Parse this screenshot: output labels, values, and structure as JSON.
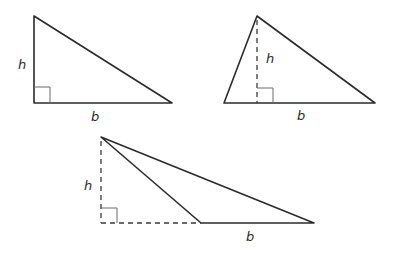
{
  "figure": {
    "triangles": [
      {
        "id": "right-triangle",
        "type": "right",
        "vertices": [
          [
            34,
            16
          ],
          [
            34,
            103
          ],
          [
            172,
            103
          ]
        ],
        "height_line": null,
        "base_extension": null,
        "right_angle_box": [
          34,
          87,
          16
        ],
        "labels": {
          "height": "h",
          "base": "b"
        },
        "label_positions": {
          "height": [
            18,
            69
          ],
          "base": [
            91,
            121
          ]
        }
      },
      {
        "id": "acute-triangle",
        "type": "acute",
        "vertices": [
          [
            257,
            16
          ],
          [
            224,
            103
          ],
          [
            375,
            103
          ]
        ],
        "height_line": [
          [
            257,
            16
          ],
          [
            257,
            103
          ]
        ],
        "base_extension": null,
        "right_angle_box": [
          257,
          88,
          16
        ],
        "labels": {
          "height": "h",
          "base": "b"
        },
        "label_positions": {
          "height": [
            266,
            63
          ],
          "base": [
            297,
            120
          ]
        }
      },
      {
        "id": "obtuse-triangle",
        "type": "obtuse",
        "vertices": [
          [
            101,
            137
          ],
          [
            201,
            223
          ],
          [
            314,
            223
          ]
        ],
        "height_line": [
          [
            101,
            137
          ],
          [
            101,
            223
          ]
        ],
        "base_extension": [
          [
            101,
            223
          ],
          [
            201,
            223
          ]
        ],
        "right_angle_box": [
          101,
          208,
          16
        ],
        "labels": {
          "height": "h",
          "base": "b"
        },
        "label_positions": {
          "height": [
            84,
            190
          ],
          "base": [
            246,
            241
          ]
        }
      }
    ],
    "colors": {
      "stroke": "#2b2b2b",
      "right_angle": "#6a6a6a",
      "background": "#ffffff"
    }
  }
}
